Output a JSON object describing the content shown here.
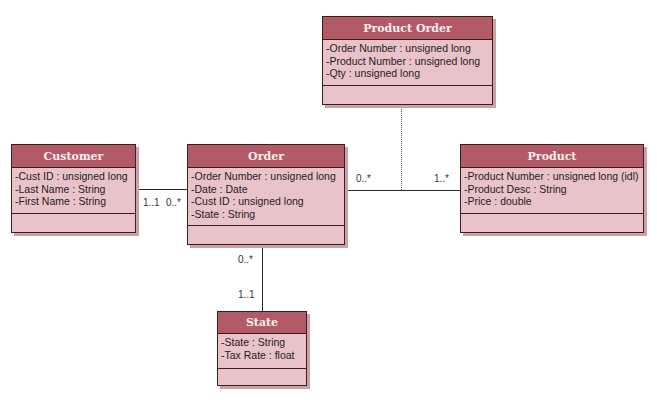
{
  "diagram": {
    "type": "uml-class-diagram",
    "classes": [
      {
        "name": "Product Order",
        "attributes": [
          "-Order Number : unsigned long",
          "-Product Number : unsigned long",
          "-Qty : unsigned long"
        ]
      },
      {
        "name": "Customer",
        "attributes": [
          "-Cust ID : unsigned long",
          "-Last Name : String",
          "-First Name : String"
        ]
      },
      {
        "name": "Order",
        "attributes": [
          "-Order Number : unsigned long",
          "-Date : Date",
          "-Cust ID : unsigned long",
          "-State : String"
        ]
      },
      {
        "name": "Product",
        "attributes": [
          "-Product Number : unsigned long (idl)",
          "-Product Desc : String",
          "-Price : double"
        ]
      },
      {
        "name": "State",
        "attributes": [
          "-State : String",
          "-Tax Rate : float"
        ]
      }
    ],
    "associations": [
      {
        "from": "Customer",
        "to": "Order",
        "from_multiplicity": "1..1",
        "to_multiplicity": "0..*"
      },
      {
        "from": "Order",
        "to": "Product",
        "from_multiplicity": "0..*",
        "to_multiplicity": "1..*",
        "association_class": "Product Order"
      },
      {
        "from": "Order",
        "to": "State",
        "from_multiplicity": "0..*",
        "to_multiplicity": "1..1"
      }
    ],
    "colors": {
      "header": "#b25a65",
      "body": "#e8c3c9",
      "border": "#3a1e22",
      "header_text": "#fbeef0"
    }
  }
}
